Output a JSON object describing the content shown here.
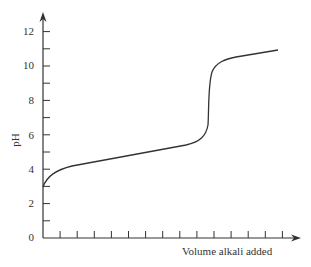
{
  "chart_data": {
    "type": "line",
    "title": "",
    "xlabel": "Volume alkali added",
    "ylabel": "pH",
    "ylim": [
      0,
      13
    ],
    "yticks": [
      0,
      2,
      4,
      6,
      8,
      10,
      12
    ],
    "y_minor_ticks": [
      1,
      3,
      5,
      7,
      9,
      11
    ],
    "x_ticks_count": 14,
    "x_tick_labels": [],
    "grid": false,
    "legend": null,
    "series": [
      {
        "name": "titration curve",
        "x": [
          0,
          1,
          2,
          3,
          4,
          5,
          6,
          7,
          8,
          9,
          9.5,
          9.8,
          10,
          10.2,
          10.5,
          11,
          12,
          13.5
        ],
        "y": [
          3.0,
          3.9,
          4.2,
          4.45,
          4.65,
          4.85,
          5.05,
          5.25,
          5.45,
          5.75,
          6.3,
          8.5,
          10.5,
          11.3,
          11.7,
          11.85,
          12.0,
          12.25
        ]
      }
    ],
    "color": "#333333"
  },
  "labels": {
    "y0": "0",
    "y2": "2",
    "y4": "4",
    "y6": "6",
    "y8": "8",
    "y10": "10",
    "y12": "12",
    "ylabel": "pH",
    "xlabel": "Volume alkali added"
  }
}
